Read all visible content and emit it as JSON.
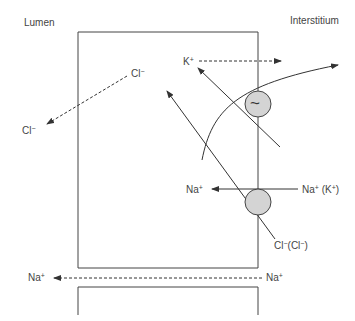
{
  "regions": {
    "left": "Lumen",
    "right": "Interstitium"
  },
  "ions": {
    "cl_cell": {
      "base": "Cl",
      "charge": "−"
    },
    "cl_lumen": {
      "base": "Cl",
      "charge": "−"
    },
    "k_cell": {
      "base": "K",
      "charge": "+"
    },
    "na_cell": {
      "base": "Na",
      "charge": "+"
    },
    "na_k_interstitium": {
      "base": "Na",
      "charge": "+",
      "suffix": " (K",
      "suffix_charge": "+",
      "suffix_close": ")"
    },
    "cl_cl_interstitium": {
      "base": "Cl",
      "charge": "−",
      "suffix": "(Cl",
      "suffix_charge": "−",
      "suffix_close": ")"
    },
    "na_paracellular_right": {
      "base": "Na",
      "charge": "+"
    },
    "na_paracellular_left": {
      "base": "Na",
      "charge": "+"
    }
  },
  "transporters": {
    "channel_symbol": "~"
  },
  "colors": {
    "line": "#333333",
    "transporter_fill": "#d4d4d4"
  }
}
